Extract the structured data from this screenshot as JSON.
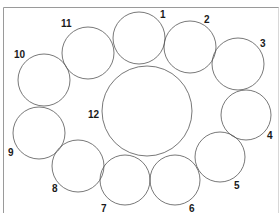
{
  "diagram": {
    "type": "circle-arrangement",
    "colors": {
      "background": "#ffffff",
      "stroke": "#555555",
      "frame": "#9a9a9a",
      "text": "#1a1a1a"
    },
    "circles": [
      {
        "id": "1",
        "label": "1",
        "cx": 139,
        "cy": 38,
        "r": 26,
        "lx": 160,
        "ly": 18
      },
      {
        "id": "2",
        "label": "2",
        "cx": 190,
        "cy": 47,
        "r": 26,
        "lx": 204,
        "ly": 23
      },
      {
        "id": "3",
        "label": "3",
        "cx": 238,
        "cy": 64,
        "r": 26,
        "lx": 260,
        "ly": 47
      },
      {
        "id": "4",
        "label": "4",
        "cx": 246,
        "cy": 115,
        "r": 25,
        "lx": 267,
        "ly": 139
      },
      {
        "id": "5",
        "label": "5",
        "cx": 220,
        "cy": 157,
        "r": 25,
        "lx": 234,
        "ly": 189
      },
      {
        "id": "6",
        "label": "6",
        "cx": 175,
        "cy": 180,
        "r": 25,
        "lx": 189,
        "ly": 212
      },
      {
        "id": "7",
        "label": "7",
        "cx": 125,
        "cy": 180,
        "r": 25,
        "lx": 101,
        "ly": 212
      },
      {
        "id": "8",
        "label": "8",
        "cx": 78,
        "cy": 166,
        "r": 26,
        "lx": 52,
        "ly": 192
      },
      {
        "id": "9",
        "label": "9",
        "cx": 39,
        "cy": 133,
        "r": 26,
        "lx": 8,
        "ly": 156
      },
      {
        "id": "10",
        "label": "10",
        "cx": 44,
        "cy": 80,
        "r": 26,
        "lx": 14,
        "ly": 58
      },
      {
        "id": "11",
        "label": "11",
        "cx": 88,
        "cy": 53,
        "r": 26,
        "lx": 61,
        "ly": 27
      },
      {
        "id": "12",
        "label": "12",
        "cx": 147,
        "cy": 111,
        "r": 45,
        "lx": 88,
        "ly": 118
      }
    ]
  }
}
